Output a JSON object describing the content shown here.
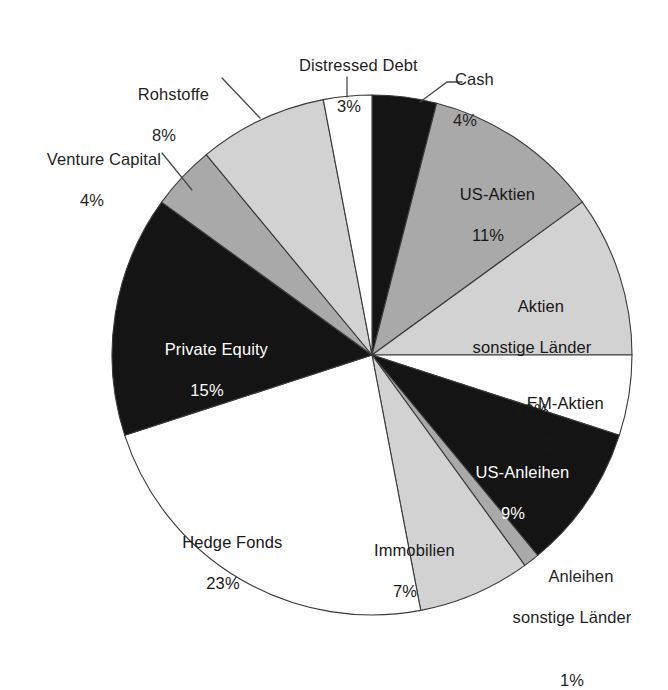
{
  "chart_data": {
    "type": "pie",
    "title": "",
    "subtitle": "",
    "xlabel": "",
    "ylabel": "",
    "legend_position": "none",
    "grid": false,
    "units": "percent",
    "start_angle_deg": 0,
    "direction": "clockwise",
    "total": 100,
    "categories": [
      "Cash",
      "US-Aktien",
      "Aktien sonstige Länder",
      "EM-Aktien",
      "US-Anleihen",
      "Anleihen sonstige Länder",
      "Immobilien",
      "Hedge Fonds",
      "Private Equity",
      "Venture Capital",
      "Rohstoffe",
      "Distressed Debt"
    ],
    "values": [
      4,
      11,
      10,
      5,
      9,
      1,
      7,
      23,
      15,
      4,
      8,
      3
    ],
    "slices": [
      {
        "label": "Cash",
        "label_lines": [
          "Cash"
        ],
        "value": 4,
        "pct_text": "4%",
        "fill": "#141414",
        "fill_name": "black",
        "placement": "outside",
        "text_color": "#1f1f1f",
        "leader": true
      },
      {
        "label": "US-Aktien",
        "label_lines": [
          "US-Aktien"
        ],
        "value": 11,
        "pct_text": "11%",
        "fill": "#a9a9a9",
        "fill_name": "medium-gray",
        "placement": "inside",
        "text_color": "#171717",
        "leader": false
      },
      {
        "label": "Aktien sonstige Länder",
        "label_lines": [
          "Aktien",
          "sonstige Länder"
        ],
        "value": 10,
        "pct_text": "10%",
        "fill": "#d2d2d2",
        "fill_name": "light-gray",
        "placement": "inside",
        "text_color": "#171717",
        "leader": false
      },
      {
        "label": "EM-Aktien",
        "label_lines": [
          "EM-Aktien"
        ],
        "value": 5,
        "pct_text": "5%",
        "fill": "#ffffff",
        "fill_name": "white",
        "placement": "inside",
        "text_color": "#171717",
        "leader": false
      },
      {
        "label": "US-Anleihen",
        "label_lines": [
          "US-Anleihen"
        ],
        "value": 9,
        "pct_text": "9%",
        "fill": "#141414",
        "fill_name": "black",
        "placement": "inside",
        "text_color": "#ffffff",
        "leader": false
      },
      {
        "label": "Anleihen sonstige Länder",
        "label_lines": [
          "Anleihen",
          "sonstige Länder"
        ],
        "value": 1,
        "pct_text": "1%",
        "fill": "#a9a9a9",
        "fill_name": "medium-gray",
        "placement": "outside",
        "text_color": "#1f1f1f",
        "leader": false
      },
      {
        "label": "Immobilien",
        "label_lines": [
          "Immobilien"
        ],
        "value": 7,
        "pct_text": "7%",
        "fill": "#d2d2d2",
        "fill_name": "light-gray",
        "placement": "inside",
        "text_color": "#171717",
        "leader": false
      },
      {
        "label": "Hedge Fonds",
        "label_lines": [
          "Hedge Fonds"
        ],
        "value": 23,
        "pct_text": "23%",
        "fill": "#ffffff",
        "fill_name": "white",
        "placement": "inside",
        "text_color": "#171717",
        "leader": false
      },
      {
        "label": "Private Equity",
        "label_lines": [
          "Private Equity"
        ],
        "value": 15,
        "pct_text": "15%",
        "fill": "#141414",
        "fill_name": "black",
        "placement": "inside",
        "text_color": "#ffffff",
        "leader": false
      },
      {
        "label": "Venture Capital",
        "label_lines": [
          "Venture Capital"
        ],
        "value": 4,
        "pct_text": "4%",
        "fill": "#a9a9a9",
        "fill_name": "medium-gray",
        "placement": "outside",
        "text_color": "#1f1f1f",
        "leader": true
      },
      {
        "label": "Rohstoffe",
        "label_lines": [
          "Rohstoffe"
        ],
        "value": 8,
        "pct_text": "8%",
        "fill": "#d2d2d2",
        "fill_name": "light-gray",
        "placement": "outside",
        "text_color": "#1f1f1f",
        "leader": true
      },
      {
        "label": "Distressed Debt",
        "label_lines": [
          "Distressed Debt"
        ],
        "value": 3,
        "pct_text": "3%",
        "fill": "#ffffff",
        "fill_name": "white",
        "placement": "outside",
        "text_color": "#1f1f1f",
        "leader": true
      }
    ],
    "colors": {
      "black": "#141414",
      "medium_gray": "#a9a9a9",
      "light_gray": "#d2d2d2",
      "white": "#ffffff",
      "outline": "#3a3a3a",
      "background": "#ffffff"
    },
    "geometry": {
      "center_x": 372,
      "center_y": 355,
      "radius": 260
    }
  },
  "labels": {
    "distressed_debt": {
      "name": "Distressed Debt",
      "pct": "3%"
    },
    "cash": {
      "name": "Cash",
      "pct": "4%"
    },
    "rohstoffe": {
      "name": "Rohstoffe",
      "pct": "8%"
    },
    "venture_capital": {
      "name": "Venture Capital",
      "pct": "4%"
    },
    "us_aktien": {
      "name": "US-Aktien",
      "pct": "11%"
    },
    "aktien_sonstige": {
      "line1": "Aktien",
      "line2": "sonstige Länder",
      "pct": "10%"
    },
    "em_aktien": {
      "name": "EM-Aktien",
      "pct": "5%"
    },
    "us_anleihen": {
      "name": "US-Anleihen",
      "pct": "9%"
    },
    "anleihen_sonstige": {
      "line1": "Anleihen",
      "line2": "sonstige Länder",
      "pct": "1%"
    },
    "immobilien": {
      "name": "Immobilien",
      "pct": "7%"
    },
    "hedge_fonds": {
      "name": "Hedge Fonds",
      "pct": "23%"
    },
    "private_equity": {
      "name": "Private Equity",
      "pct": "15%"
    }
  }
}
